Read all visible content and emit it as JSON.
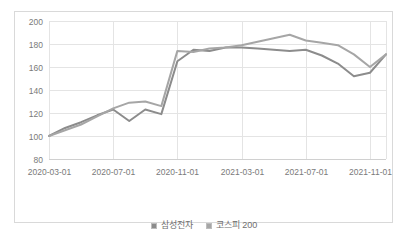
{
  "chart_data": {
    "type": "line",
    "title": "",
    "xlabel": "",
    "ylabel": "",
    "ylim": [
      80,
      200
    ],
    "yticks": [
      80,
      100,
      120,
      140,
      160,
      180,
      200
    ],
    "grid": true,
    "legend_position": "bottom",
    "x_tick_labels": [
      "2020-03-01",
      "2020-07-01",
      "2020-11-01",
      "2021-03-01",
      "2021-07-01",
      "2021-11-01"
    ],
    "x": [
      "2020-03-01",
      "2020-04-01",
      "2020-05-01",
      "2020-06-01",
      "2020-07-01",
      "2020-08-01",
      "2020-09-01",
      "2020-10-01",
      "2020-11-01",
      "2020-12-01",
      "2021-01-01",
      "2021-02-01",
      "2021-03-01",
      "2021-04-01",
      "2021-05-01",
      "2021-06-01",
      "2021-07-01",
      "2021-08-01",
      "2021-09-01",
      "2021-10-01",
      "2021-11-01",
      "2021-12-01"
    ],
    "series": [
      {
        "name": "삼성전자",
        "color": "#8c8c8c",
        "values": [
          100,
          107,
          112,
          118,
          123,
          113,
          123,
          119,
          165,
          175,
          174,
          177,
          177,
          176,
          175,
          174,
          175,
          170,
          163,
          152,
          155,
          171
        ]
      },
      {
        "name": "코스피 200",
        "color": "#a6a6a6",
        "values": [
          100,
          105,
          110,
          117,
          124,
          129,
          130,
          126,
          174,
          173,
          176,
          177,
          179,
          182,
          185,
          188,
          183,
          181,
          179,
          171,
          160,
          171
        ]
      }
    ]
  },
  "legend": {
    "items": [
      {
        "label": "삼성전자",
        "color": "#8c8c8c"
      },
      {
        "label": "코스피 200",
        "color": "#a6a6a6"
      }
    ]
  },
  "axes": {
    "y_tick_0": "80",
    "y_tick_1": "100",
    "y_tick_2": "120",
    "y_tick_3": "140",
    "y_tick_4": "160",
    "y_tick_5": "180",
    "y_tick_6": "200",
    "x_tick_0": "2020-03-01",
    "x_tick_1": "2020-07-01",
    "x_tick_2": "2020-11-01",
    "x_tick_3": "2021-03-01",
    "x_tick_4": "2021-07-01",
    "x_tick_5": "2021-11-01"
  },
  "colors": {
    "grid": "#e4e4e4",
    "axis": "#d0d0d0",
    "border": "#d9d9d9",
    "tick_text": "#7a7a7a",
    "legend_text": "#6f6f6f",
    "background": "#ffffff"
  }
}
